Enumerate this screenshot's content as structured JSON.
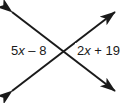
{
  "figure": {
    "type": "vertical-angles-diagram",
    "background_color": "#ffffff",
    "stroke_color": "#1a1a1a",
    "stroke_width": 2,
    "intersection": {
      "x": 64,
      "y": 50
    },
    "lines": [
      {
        "name": "line-nw-se",
        "from": {
          "x": 8,
          "y": 8
        },
        "to": {
          "x": 119,
          "y": 95
        },
        "arrow_start": true,
        "arrow_end": true
      },
      {
        "name": "line-sw-ne",
        "from": {
          "x": 8,
          "y": 95
        },
        "to": {
          "x": 119,
          "y": 8
        },
        "arrow_start": true,
        "arrow_end": true
      }
    ],
    "labels": {
      "left": {
        "name": "left-angle-expression",
        "coefficient": "5",
        "variable": "x",
        "operator": "–",
        "constant": "8",
        "text": "5x – 8"
      },
      "right": {
        "name": "right-angle-expression",
        "coefficient": "2",
        "variable": "x",
        "operator": "+",
        "constant": "19",
        "text": "2x + 19"
      }
    }
  }
}
